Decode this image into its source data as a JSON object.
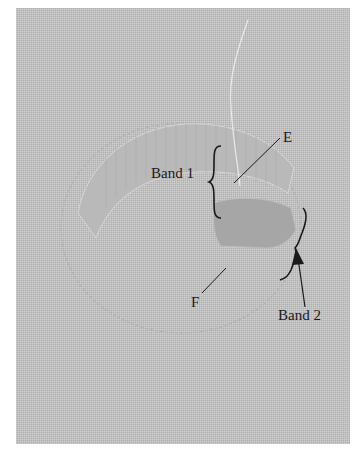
{
  "figure": {
    "labels": {
      "band1": "Band 1",
      "band2": "Band 2",
      "point_e": "E",
      "point_f": "F"
    },
    "colors": {
      "fabric": "#c4c4c4",
      "stitching_band1": "#b8b8b8",
      "stitching_band2": "#a9a9a9",
      "thread": "#e6e6e6",
      "annotation": "#1a1a1a",
      "border": "#ffffff"
    }
  }
}
